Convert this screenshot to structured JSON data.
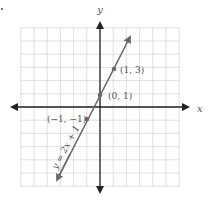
{
  "chart_data": {
    "type": "line",
    "title": "",
    "xlabel": "x",
    "ylabel": "y",
    "xlim": [
      -6,
      6
    ],
    "ylim": [
      -6,
      6
    ],
    "grid": true,
    "series": [
      {
        "name": "y = 2x + 1",
        "slope": 2,
        "intercept": 1,
        "x": [
          -3.5,
          2.5
        ],
        "y": [
          -6,
          6
        ]
      }
    ],
    "points": [
      {
        "x": -1,
        "y": -1,
        "label": "(−1, −1)"
      },
      {
        "x": 0,
        "y": 1,
        "label": "(0, 1)"
      },
      {
        "x": 1,
        "y": 3,
        "label": "(1, 3)"
      }
    ],
    "annotations": [
      {
        "text": "y = 2x + 1",
        "position": "along line, lower left"
      }
    ]
  },
  "labels": {
    "x_axis": "x",
    "y_axis": "y",
    "line_equation": "y = 2x + 1",
    "p1": "(1, 3)",
    "p2": "(0, 1)",
    "p3": "(−1, −1)"
  },
  "colors": {
    "axis": "#222222",
    "grid": "#d8d8d8",
    "line": "#6a6a6a",
    "point": "#6a6a6a",
    "text": "#555555"
  }
}
